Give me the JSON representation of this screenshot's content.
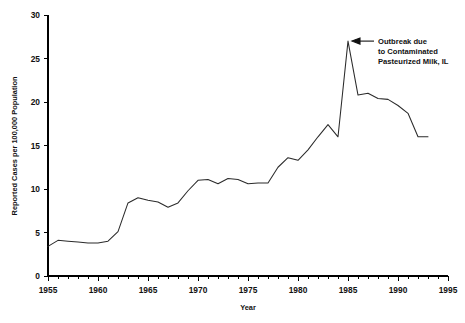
{
  "chart_data": {
    "type": "line",
    "title": "",
    "xlabel": "Year",
    "ylabel": "Reported Cases per 100,000 Population",
    "xlim": [
      1955,
      1995
    ],
    "ylim": [
      0,
      30
    ],
    "xticks": [
      "1955",
      "1960",
      "1965",
      "1970",
      "1975",
      "1980",
      "1985",
      "1990",
      "1995"
    ],
    "yticks": [
      "0",
      "5",
      "10",
      "15",
      "20",
      "25",
      "30"
    ],
    "xtick_step_minor": 1,
    "ytick_step": 5,
    "grid": false,
    "legend": "none",
    "x": [
      1955,
      1956,
      1957,
      1958,
      1959,
      1960,
      1961,
      1962,
      1963,
      1964,
      1965,
      1966,
      1967,
      1968,
      1969,
      1970,
      1971,
      1972,
      1973,
      1974,
      1975,
      1976,
      1977,
      1978,
      1979,
      1980,
      1981,
      1982,
      1983,
      1984,
      1985,
      1986,
      1987,
      1988,
      1989,
      1990,
      1991,
      1992,
      1993
    ],
    "series": [
      {
        "name": "Reported Cases per 100,000 Population",
        "values": [
          3.4,
          4.1,
          4.0,
          3.9,
          3.8,
          3.8,
          4.0,
          5.1,
          8.4,
          9.0,
          8.7,
          8.5,
          7.9,
          8.4,
          9.8,
          11.0,
          11.1,
          10.6,
          11.2,
          11.1,
          10.6,
          10.7,
          10.7,
          12.5,
          13.6,
          13.3,
          14.5,
          16.0,
          17.4,
          16.0,
          27.0,
          20.8,
          21.0,
          20.4,
          20.3,
          19.6,
          18.7,
          16.0,
          16.0
        ]
      }
    ],
    "annotations": [
      {
        "name": "outbreak-annotation",
        "lines": [
          "Outbreak due",
          "to Contaminated",
          "Pasteurized Milk, IL"
        ],
        "points_to_year": 1985,
        "points_to_value": 27.0,
        "arrow": "left-arrow"
      }
    ]
  }
}
